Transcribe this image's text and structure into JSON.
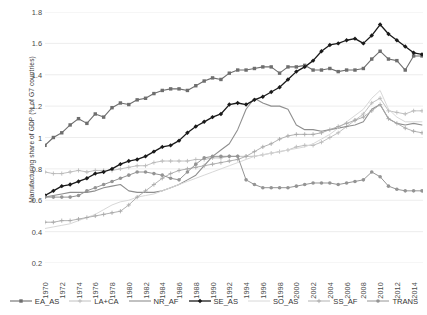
{
  "chart_data": {
    "type": "line",
    "title": "",
    "xlabel": "",
    "ylabel": "Manufacturing share of GDP (% of G7 countries)",
    "ylim": [
      0.2,
      1.8
    ],
    "ytick_step": 0.2,
    "ytick_labels": [
      "1.8",
      "1.6",
      "1.4",
      "1.2",
      "1",
      "0.8",
      "0.6",
      "0.4",
      "0.2"
    ],
    "grid": "horizontal",
    "legend_position": "bottom",
    "x": [
      1970,
      1971,
      1972,
      1973,
      1974,
      1975,
      1976,
      1977,
      1978,
      1979,
      1980,
      1981,
      1982,
      1983,
      1984,
      1985,
      1986,
      1987,
      1988,
      1989,
      1990,
      1991,
      1992,
      1993,
      1994,
      1995,
      1996,
      1997,
      1998,
      1999,
      2000,
      2001,
      2002,
      2003,
      2004,
      2005,
      2006,
      2007,
      2008,
      2009,
      2010,
      2011,
      2012,
      2013,
      2014,
      2015
    ],
    "xtick_labels": [
      "1970",
      "1972",
      "1974",
      "1976",
      "1978",
      "1980",
      "1982",
      "1984",
      "1986",
      "1988",
      "1990",
      "1992",
      "1994",
      "1996",
      "1998",
      "2000",
      "2002",
      "2004",
      "2006",
      "2008",
      "2010",
      "2012",
      "2014"
    ],
    "series": [
      {
        "name": "EA_AS",
        "color": "#6e6e6e",
        "marker": "square",
        "linewidth": 1.1,
        "values": [
          0.95,
          1.0,
          1.03,
          1.08,
          1.12,
          1.09,
          1.15,
          1.13,
          1.19,
          1.22,
          1.21,
          1.24,
          1.25,
          1.28,
          1.3,
          1.31,
          1.31,
          1.3,
          1.33,
          1.36,
          1.38,
          1.37,
          1.41,
          1.43,
          1.43,
          1.44,
          1.45,
          1.45,
          1.41,
          1.45,
          1.45,
          1.46,
          1.43,
          1.43,
          1.44,
          1.42,
          1.43,
          1.43,
          1.44,
          1.5,
          1.55,
          1.5,
          1.49,
          1.43,
          1.52,
          1.52
        ]
      },
      {
        "name": "LA+CA",
        "color": "#b9b9b9",
        "marker": "cross",
        "linewidth": 0.9,
        "values": [
          0.78,
          0.77,
          0.77,
          0.78,
          0.79,
          0.78,
          0.79,
          0.79,
          0.79,
          0.8,
          0.81,
          0.82,
          0.82,
          0.84,
          0.85,
          0.85,
          0.85,
          0.85,
          0.86,
          0.86,
          0.87,
          0.87,
          0.88,
          0.88,
          0.88,
          0.88,
          0.89,
          0.9,
          0.91,
          0.92,
          0.94,
          0.95,
          0.95,
          0.97,
          1.0,
          1.03,
          1.07,
          1.11,
          1.15,
          1.22,
          1.25,
          1.17,
          1.16,
          1.15,
          1.17,
          1.17
        ]
      },
      {
        "name": "NR_AF",
        "color": "#8f8f8f",
        "marker": "none",
        "linewidth": 1.1,
        "values": [
          0.62,
          0.63,
          0.64,
          0.65,
          0.65,
          0.65,
          0.66,
          0.68,
          0.69,
          0.7,
          0.66,
          0.65,
          0.65,
          0.65,
          0.66,
          0.68,
          0.7,
          0.73,
          0.76,
          0.82,
          0.88,
          0.92,
          0.96,
          1.05,
          1.18,
          1.25,
          1.22,
          1.2,
          1.2,
          1.18,
          1.08,
          1.05,
          1.05,
          1.04,
          1.05,
          1.06,
          1.07,
          1.08,
          1.1,
          1.18,
          1.21,
          1.12,
          1.09,
          1.08,
          1.09,
          1.08
        ]
      },
      {
        "name": "SE_AS",
        "color": "#1a1a1a",
        "marker": "diamond",
        "linewidth": 1.3,
        "values": [
          0.63,
          0.66,
          0.69,
          0.7,
          0.72,
          0.74,
          0.77,
          0.78,
          0.8,
          0.83,
          0.85,
          0.86,
          0.88,
          0.91,
          0.94,
          0.95,
          0.98,
          1.03,
          1.07,
          1.1,
          1.13,
          1.15,
          1.21,
          1.22,
          1.21,
          1.24,
          1.26,
          1.29,
          1.32,
          1.37,
          1.42,
          1.45,
          1.49,
          1.55,
          1.59,
          1.6,
          1.62,
          1.63,
          1.6,
          1.65,
          1.72,
          1.66,
          1.62,
          1.58,
          1.54,
          1.53
        ]
      },
      {
        "name": "SO_AS",
        "color": "#d8d8d8",
        "marker": "none",
        "linewidth": 1.0,
        "values": [
          0.42,
          0.43,
          0.44,
          0.45,
          0.47,
          0.49,
          0.51,
          0.54,
          0.57,
          0.59,
          0.6,
          0.62,
          0.63,
          0.64,
          0.66,
          0.68,
          0.7,
          0.72,
          0.74,
          0.76,
          0.78,
          0.8,
          0.82,
          0.84,
          0.86,
          0.88,
          0.89,
          0.9,
          0.91,
          0.92,
          0.93,
          0.94,
          0.96,
          0.99,
          1.02,
          1.06,
          1.1,
          1.14,
          1.18,
          1.25,
          1.3,
          1.18,
          1.13,
          1.1,
          1.1,
          1.1
        ]
      },
      {
        "name": "SS_AF",
        "color": "#a8a8a8",
        "marker": "cross",
        "linewidth": 0.9,
        "values": [
          0.46,
          0.46,
          0.47,
          0.47,
          0.48,
          0.49,
          0.5,
          0.51,
          0.52,
          0.53,
          0.57,
          0.62,
          0.66,
          0.7,
          0.74,
          0.77,
          0.79,
          0.8,
          0.81,
          0.82,
          0.83,
          0.84,
          0.85,
          0.86,
          0.88,
          0.91,
          0.94,
          0.96,
          0.99,
          1.01,
          1.02,
          1.02,
          1.02,
          1.03,
          1.05,
          1.07,
          1.09,
          1.11,
          1.13,
          1.17,
          1.21,
          1.12,
          1.09,
          1.06,
          1.04,
          1.03
        ]
      },
      {
        "name": "TRANS",
        "color": "#949494",
        "marker": "circle",
        "linewidth": 1.0,
        "values": [
          0.62,
          0.62,
          0.62,
          0.62,
          0.63,
          0.66,
          0.68,
          0.7,
          0.72,
          0.74,
          0.76,
          0.78,
          0.78,
          0.77,
          0.76,
          0.74,
          0.73,
          0.78,
          0.83,
          0.87,
          0.88,
          0.88,
          0.88,
          0.88,
          0.73,
          0.7,
          0.68,
          0.68,
          0.68,
          0.68,
          0.69,
          0.7,
          0.71,
          0.71,
          0.71,
          0.7,
          0.71,
          0.72,
          0.73,
          0.78,
          0.75,
          0.69,
          0.67,
          0.66,
          0.66,
          0.66
        ]
      }
    ]
  },
  "legend": {
    "items": [
      {
        "label": "EA_AS"
      },
      {
        "label": "LA+CA"
      },
      {
        "label": "NR_AF"
      },
      {
        "label": "SE_AS"
      },
      {
        "label": "SO_AS"
      },
      {
        "label": "SS_AF"
      },
      {
        "label": "TRANS"
      }
    ]
  }
}
